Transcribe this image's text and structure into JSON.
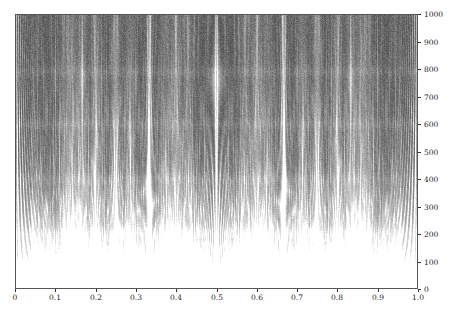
{
  "figure": {
    "width": 469,
    "height": 321,
    "background_color": "#ffffff",
    "plot_background_color": "#3c3c3c",
    "frame_color": "#555555",
    "tick_color": "#333333",
    "label_color": "#1a1a1a"
  },
  "axes": {
    "x": {
      "position": "bottom",
      "min": 0,
      "max": 1.0,
      "tick_values": [
        0,
        0.1,
        0.2,
        0.3,
        0.4,
        0.5,
        0.6,
        0.7,
        0.8,
        0.9,
        1.0
      ],
      "tick_labels": [
        "0",
        "0.1",
        "0.2",
        "0.3",
        "0.4",
        "0.5",
        "0.6",
        "0.7",
        "0.8",
        "0.9",
        "1.0"
      ],
      "label": ""
    },
    "y": {
      "position": "right",
      "min": 0,
      "max": 1000,
      "tick_values": [
        0,
        100,
        200,
        300,
        400,
        500,
        600,
        700,
        800,
        900,
        1000
      ],
      "tick_labels": [
        "0",
        "100",
        "200",
        "300",
        "400",
        "500",
        "600",
        "700",
        "800",
        "900",
        "1000"
      ],
      "label": ""
    }
  },
  "chart_data": {
    "type": "heatmap",
    "title": "",
    "subtitle": "",
    "xlabel": "",
    "ylabel": "",
    "xlim": [
      0,
      1.0
    ],
    "ylim": [
      0,
      1000
    ],
    "grid": false,
    "legend": "none",
    "colormap": "gray",
    "colormap_low_color": "#2e2e2e",
    "colormap_high_color": "#ffffff",
    "x_feature_lines": [
      {
        "x": 0.5,
        "strength": 1.0,
        "label": "1/2"
      },
      {
        "x": 0.3333,
        "strength": 0.72,
        "label": "1/3"
      },
      {
        "x": 0.6667,
        "strength": 0.72,
        "label": "2/3"
      },
      {
        "x": 0.25,
        "strength": 0.55,
        "label": "1/4"
      },
      {
        "x": 0.75,
        "strength": 0.55,
        "label": "3/4"
      },
      {
        "x": 0.2,
        "strength": 0.42,
        "label": "1/5"
      },
      {
        "x": 0.4,
        "strength": 0.42,
        "label": "2/5"
      },
      {
        "x": 0.6,
        "strength": 0.42,
        "label": "3/5"
      },
      {
        "x": 0.8,
        "strength": 0.42,
        "label": "4/5"
      },
      {
        "x": 0.1667,
        "strength": 0.34,
        "label": "1/6"
      },
      {
        "x": 0.8333,
        "strength": 0.34,
        "label": "5/6"
      },
      {
        "x": 0.1429,
        "strength": 0.28,
        "label": "1/7"
      },
      {
        "x": 0.2857,
        "strength": 0.28,
        "label": "2/7"
      },
      {
        "x": 0.4286,
        "strength": 0.28,
        "label": "3/7"
      },
      {
        "x": 0.5714,
        "strength": 0.28,
        "label": "4/7"
      },
      {
        "x": 0.7143,
        "strength": 0.28,
        "label": "5/7"
      },
      {
        "x": 0.8571,
        "strength": 0.28,
        "label": "6/7"
      },
      {
        "x": 0.125,
        "strength": 0.24,
        "label": "1/8"
      },
      {
        "x": 0.375,
        "strength": 0.24,
        "label": "3/8"
      },
      {
        "x": 0.625,
        "strength": 0.24,
        "label": "5/8"
      },
      {
        "x": 0.875,
        "strength": 0.24,
        "label": "7/8"
      },
      {
        "x": 0.0,
        "strength": 0.9,
        "label": "0"
      },
      {
        "x": 1.0,
        "strength": 0.9,
        "label": "1"
      }
    ],
    "horizontal_bands": [
      {
        "y": 200,
        "note": "brightness step"
      },
      {
        "y": 400,
        "note": "brightness step"
      },
      {
        "y": 600,
        "note": "faint step"
      },
      {
        "y": 790,
        "note": "faint step"
      }
    ],
    "brightness_profile": [
      {
        "y": 0,
        "mean_level": 0.99
      },
      {
        "y": 50,
        "mean_level": 0.96
      },
      {
        "y": 100,
        "mean_level": 0.9
      },
      {
        "y": 150,
        "mean_level": 0.8
      },
      {
        "y": 200,
        "mean_level": 0.68
      },
      {
        "y": 250,
        "mean_level": 0.56
      },
      {
        "y": 300,
        "mean_level": 0.48
      },
      {
        "y": 350,
        "mean_level": 0.42
      },
      {
        "y": 400,
        "mean_level": 0.36
      },
      {
        "y": 500,
        "mean_level": 0.3
      },
      {
        "y": 600,
        "mean_level": 0.27
      },
      {
        "y": 700,
        "mean_level": 0.25
      },
      {
        "y": 800,
        "mean_level": 0.24
      },
      {
        "y": 900,
        "mean_level": 0.23
      },
      {
        "y": 1000,
        "mean_level": 0.23
      }
    ]
  }
}
